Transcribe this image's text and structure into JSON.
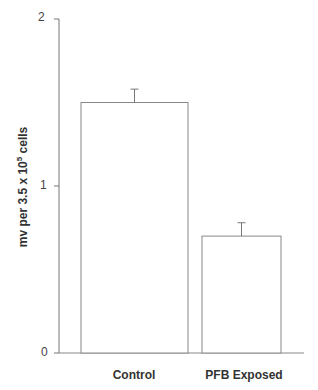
{
  "chart_data": {
    "type": "bar",
    "title": "",
    "xlabel": "",
    "ylabel": "mv per 3.5 x 10^5 cells",
    "ylabel_parts": {
      "pre": "mv  per 3.5 x 10",
      "sup": "5",
      "post": " cells"
    },
    "categories": [
      "Control",
      "PFB Exposed"
    ],
    "values": [
      1.5,
      0.7
    ],
    "error_bars": [
      0.08,
      0.08
    ],
    "ylim": [
      0,
      2
    ],
    "yticks": [
      "0",
      "1",
      "2"
    ],
    "grid": false,
    "legend": null,
    "bar_fill": "#ffffff",
    "bar_stroke": "#888888"
  }
}
